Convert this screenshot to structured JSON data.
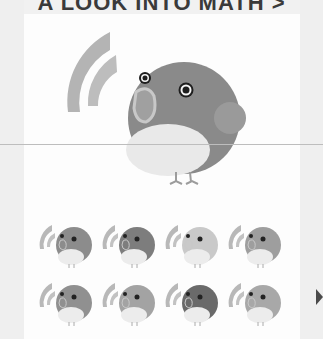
{
  "header": {
    "title": "A LOOK INTO MATH >"
  },
  "hero": {
    "icon": "bird-with-signal-waves-icon",
    "colors": {
      "body": "#8a8a8a",
      "belly": "#e9e9e9",
      "beak": "#a0a0a0",
      "beak_outline": "#c8c8c8",
      "wing": "#9a9a9a",
      "waves": "#b4b4b4",
      "eye_ring": "#f4f4f4",
      "eye_pupil": "#1e1e1e",
      "legs": "#9c9c9c"
    }
  },
  "grid": {
    "items": [
      {
        "name": "bird-variant-1",
        "body": "#8c8c8c"
      },
      {
        "name": "bird-variant-2",
        "body": "#7d7d7d"
      },
      {
        "name": "bird-variant-3",
        "body": "#c9c9c9"
      },
      {
        "name": "bird-variant-4",
        "body": "#9e9e9e"
      },
      {
        "name": "bird-variant-5",
        "body": "#909090"
      },
      {
        "name": "bird-variant-6",
        "body": "#a3a3a3"
      },
      {
        "name": "bird-variant-7",
        "body": "#6a6a6a"
      },
      {
        "name": "bird-variant-8",
        "body": "#a8a8a8"
      }
    ]
  },
  "nav": {
    "next_icon": "chevron-right-icon"
  }
}
